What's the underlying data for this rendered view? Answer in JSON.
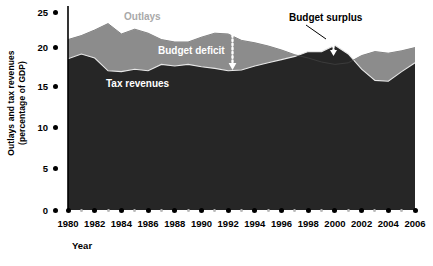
{
  "chart_data": {
    "type": "area",
    "title": "",
    "xlabel": "Year",
    "ylabel_line1": "Outlays and tax revenues",
    "ylabel_line2": "(percentage of GDP)",
    "xlim": [
      1980,
      2006
    ],
    "ylim": [
      0,
      25
    ],
    "ytick_labels": [
      "0",
      "5",
      "10",
      "15",
      "20",
      "25"
    ],
    "ytick_values": [
      0,
      5,
      10,
      15,
      20,
      25
    ],
    "xtick_labels": [
      "1980",
      "1982",
      "1984",
      "1986",
      "1988",
      "1990",
      "1992",
      "1994",
      "1996",
      "1998",
      "2000",
      "2002",
      "2004",
      "2006"
    ],
    "xtick_values": [
      1980,
      1982,
      1984,
      1986,
      1988,
      1990,
      1992,
      1994,
      1996,
      1998,
      2000,
      2002,
      2004,
      2006
    ],
    "grid": false,
    "legend_position": "inline-annotations",
    "x": [
      1980,
      1981,
      1982,
      1983,
      1984,
      1985,
      1986,
      1987,
      1988,
      1989,
      1990,
      1991,
      1992,
      1993,
      1994,
      1995,
      1996,
      1997,
      1998,
      1999,
      2000,
      2001,
      2002,
      2003,
      2004,
      2005,
      2006
    ],
    "series": [
      {
        "name": "Outlays",
        "color": "#8c8c8c",
        "values": [
          21.3,
          21.8,
          22.5,
          23.3,
          22.0,
          22.6,
          22.1,
          21.3,
          21.0,
          21.0,
          21.6,
          22.1,
          22.0,
          21.2,
          20.9,
          20.5,
          20.0,
          19.4,
          19.0,
          18.5,
          18.2,
          18.4,
          19.3,
          19.8,
          19.6,
          19.9,
          20.3
        ]
      },
      {
        "name": "Tax revenues",
        "color": "#262626",
        "values": [
          18.9,
          19.5,
          19.0,
          17.4,
          17.3,
          17.6,
          17.4,
          18.2,
          18.0,
          18.2,
          17.9,
          17.7,
          17.4,
          17.5,
          18.0,
          18.4,
          18.8,
          19.2,
          19.8,
          19.8,
          20.6,
          19.5,
          17.6,
          16.2,
          16.1,
          17.3,
          18.4
        ]
      }
    ],
    "annotations": [
      {
        "text": "Outlays",
        "series": "outlays",
        "color": "#a9a9a9"
      },
      {
        "text": "Budget deficit",
        "color": "#ffffff"
      },
      {
        "text": "Tax revenues",
        "color": "#ffffff"
      },
      {
        "text": "Budget surplus",
        "color": "#000000"
      }
    ]
  },
  "axis": {
    "x_title": "Year",
    "y_title_line1": "Outlays and tax revenues",
    "y_title_line2": "(percentage of GDP)"
  },
  "labels": {
    "outlays": "Outlays",
    "budget_deficit": "Budget deficit",
    "tax_revenues": "Tax revenues",
    "budget_surplus": "Budget surplus"
  },
  "ytick": {
    "t0": "0",
    "t1": "5",
    "t2": "10",
    "t3": "15",
    "t4": "20",
    "t5": "25"
  },
  "xtick": {
    "t0": "1980",
    "t1": "1982",
    "t2": "1984",
    "t3": "1986",
    "t4": "1988",
    "t5": "1990",
    "t6": "1992",
    "t7": "1994",
    "t8": "1996",
    "t9": "1998",
    "t10": "2000",
    "t11": "2002",
    "t12": "2004",
    "t13": "2006"
  },
  "colors": {
    "outlays_fill": "#8c8c8c",
    "tax_fill": "#262626",
    "axis": "#000000",
    "minor_tick": "#b9b9b9"
  }
}
